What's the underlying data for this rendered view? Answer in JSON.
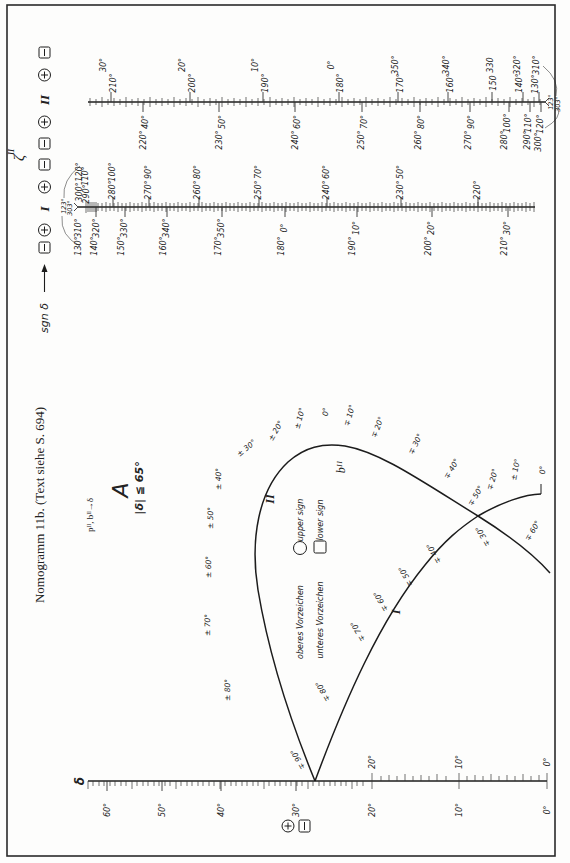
{
  "page": {
    "title": "Nomogramm 11b. (Text siehe S. 694)",
    "subtitle": "pᴵᴵ, bᴵᴵ→δ",
    "region_label": "A",
    "condition": "|δ| ≦ 65°",
    "border_color": "#2a2a2a",
    "ink_color": "#1c1c1c"
  },
  "sign_column": {
    "symbol": "ζ",
    "symbol_sup": "II",
    "sgn_label": "sgn δ",
    "markers_top": [
      "minus",
      "plus",
      "II",
      "plus",
      "minus"
    ],
    "markers_bottom": [
      "minus",
      "plus",
      "I",
      "plus",
      "minus"
    ]
  },
  "legend": {
    "upper": {
      "de": "oberes Vorzeichen",
      "en": "upper sign",
      "shape": "circle"
    },
    "lower": {
      "de": "unteres Vorzeichen",
      "en": "lower sign",
      "shape": "square"
    }
  },
  "scale_II": {
    "name": "II",
    "above_outer": [
      "30°",
      "20°",
      "10°",
      "0°",
      "350°",
      "340°",
      "330",
      "320°",
      "310°"
    ],
    "above_inner": [
      "210°",
      "200°",
      "190°",
      "180°",
      "170°",
      "160°",
      "150",
      "140°",
      "130°"
    ],
    "below_inner": [
      "40°",
      "50°",
      "60°",
      "70°",
      "80°",
      "90°",
      "100°",
      "110°",
      "120°"
    ],
    "below_outer": [
      "220°",
      "230°",
      "240°",
      "250°",
      "260°",
      "270°",
      "280°",
      "290°",
      "300°"
    ],
    "end_labels": [
      "123°",
      "303°"
    ]
  },
  "scale_I": {
    "name": "I",
    "above_outer": [
      "120°",
      "110°",
      "100°",
      "90°",
      "80°",
      "70°",
      "60°",
      "50°"
    ],
    "above_inner": [
      "300°",
      "290°",
      "280°",
      "270°",
      "260°",
      "250°",
      "240°",
      "230°",
      "220°"
    ],
    "below_inner": [
      "310°",
      "320°",
      "330°",
      "340°",
      "350°",
      "0°",
      "10°",
      "20°",
      "30°"
    ],
    "below_outer": [
      "130°",
      "140°",
      "150°",
      "160°",
      "170°",
      "180°",
      "190°",
      "200°",
      "210°"
    ],
    "end_labels": [
      "123°",
      "303°"
    ]
  },
  "delta_scale": {
    "symbol": "δ",
    "below": [
      "60°",
      "50°",
      "40°",
      "30°",
      "20°",
      "10°",
      "0°"
    ],
    "above": [
      "20°",
      "10°",
      "0°"
    ],
    "markers": [
      "plus",
      "minus"
    ]
  },
  "curve_I": {
    "name": "I",
    "labels": [
      "∓ 90°",
      "∓ 80°",
      "∓ 70°",
      "∓ 60°",
      "∓ 50°",
      "∓ 40°",
      "∓ 30°",
      "∓ 20°",
      "± 10°",
      "0°"
    ]
  },
  "curve_II": {
    "name": "II",
    "param_label": "bᴵᴵ",
    "labels": [
      "± 80°",
      "± 70°",
      "± 60°",
      "± 50°",
      "± 40°",
      "± 30°",
      "± 20°",
      "± 10°",
      "0°",
      "∓ 10°",
      "∓ 20°",
      "∓ 30°",
      "∓ 40°",
      "∓ 50°",
      "∓ 60°"
    ]
  }
}
